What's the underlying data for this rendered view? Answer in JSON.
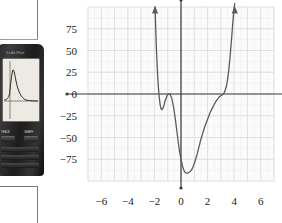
{
  "calculator": {
    "brand_label": "TI-83 Plus",
    "key_left_label": "TRACE",
    "key_right_label": "GRAPH",
    "screen_alt": "calculator-graph-screen"
  },
  "chart_data": {
    "type": "line",
    "title": "",
    "xlabel": "x",
    "ylabel": "y",
    "xlim": [
      -7,
      7
    ],
    "ylim": [
      -100,
      100
    ],
    "xticks": [
      -6,
      -4,
      -2,
      0,
      2,
      4,
      6
    ],
    "xtick_labels": [
      "−6",
      "−4",
      "−2",
      "0",
      "2",
      "4",
      "6"
    ],
    "yticks": [
      75,
      50,
      25,
      0,
      -25,
      -50,
      -75
    ],
    "ytick_labels": [
      "75",
      "50",
      "25",
      "0",
      "−25",
      "−50",
      "−75"
    ],
    "grid": true,
    "grid_minor": true,
    "legend": "none",
    "curve_color": "#5a5a5a",
    "axis_color": "#3a3a3a",
    "grid_color": "#d9d9d9",
    "grid_minor_color": "#ececec",
    "arrow_left_x": -1.95,
    "arrow_right_x": 4.05,
    "features": {
      "local_min_1": [
        -1.5,
        -18
      ],
      "local_max_1": [
        -0.8,
        0
      ],
      "local_min_2": [
        0.7,
        -90
      ],
      "x_intercepts": [
        -0.8,
        3.2
      ]
    },
    "series": [
      {
        "name": "polynomial",
        "x": [
          -1.95,
          -1.9,
          -1.85,
          -1.8,
          -1.75,
          -1.7,
          -1.65,
          -1.6,
          -1.55,
          -1.5,
          -1.45,
          -1.4,
          -1.35,
          -1.3,
          -1.25,
          -1.2,
          -1.15,
          -1.1,
          -1.05,
          -1.0,
          -0.95,
          -0.9,
          -0.85,
          -0.8,
          -0.75,
          -0.7,
          -0.65,
          -0.6,
          -0.55,
          -0.5,
          -0.4,
          -0.3,
          -0.2,
          -0.1,
          0.0,
          0.1,
          0.2,
          0.3,
          0.4,
          0.5,
          0.6,
          0.7,
          0.8,
          0.9,
          1.0,
          1.1,
          1.2,
          1.3,
          1.4,
          1.5,
          1.6,
          1.7,
          1.8,
          1.9,
          2.0,
          2.1,
          2.2,
          2.3,
          2.4,
          2.5,
          2.6,
          2.7,
          2.8,
          2.9,
          3.0,
          3.1,
          3.2,
          3.3,
          3.4,
          3.5,
          3.6,
          3.7,
          3.8,
          3.9,
          4.0,
          4.05
        ],
        "y": [
          100,
          74,
          52,
          34,
          19,
          7,
          -2,
          -9,
          -14,
          -17,
          -18,
          -17,
          -16,
          -14,
          -11,
          -8,
          -6,
          -4,
          -2,
          -1,
          -0.3,
          0,
          0,
          -1,
          -3,
          -5,
          -8,
          -12,
          -16,
          -21,
          -32,
          -44,
          -56,
          -67,
          -75,
          -82,
          -87,
          -90,
          -91,
          -91,
          -90,
          -89,
          -87,
          -84,
          -80,
          -75,
          -70,
          -64,
          -58,
          -52,
          -47,
          -42,
          -37,
          -33,
          -29,
          -25,
          -21,
          -18,
          -15,
          -12,
          -9,
          -7,
          -5,
          -3,
          -2,
          -1,
          0,
          3,
          8,
          16,
          28,
          44,
          62,
          82,
          100,
          104
        ]
      }
    ]
  }
}
